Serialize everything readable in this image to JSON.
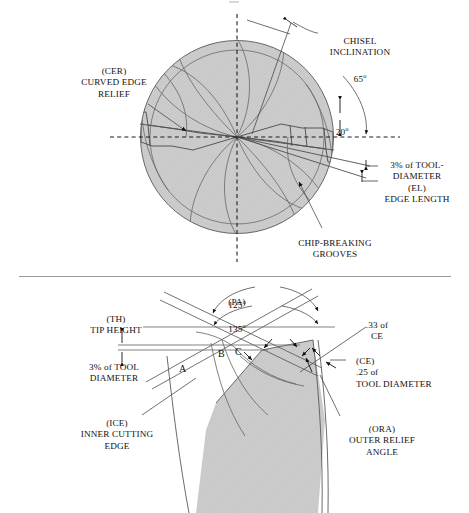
{
  "page": {
    "width": 469,
    "height": 513,
    "background": "#ffffff",
    "ink": "#111111",
    "hatch_fill": "#c9c9c9",
    "line_color": "#555555",
    "divider_color": "#9a9a9a"
  },
  "figure_top": {
    "name": "drill-point-end-view",
    "circle": {
      "cx": 237,
      "cy": 137,
      "r": 97
    },
    "labels": {
      "cer": "(CER)\nCURVED EDGE\nRELIEF",
      "chisel_inclination": "CHISEL\nINCLINATION",
      "chisel_inclination_value": "65",
      "chisel_inclination_unit": "o",
      "angle_20_value": "20",
      "angle_20_unit": "o",
      "edge_length": "3% of TOOL-\nDIAMETER\n(EL)\nEDGE LENGTH",
      "chip_grooves": "CHIP-BREAKING\nGROOVES"
    }
  },
  "figure_bottom": {
    "name": "drill-point-side-view",
    "labels": {
      "pa_upper_value": "125",
      "pa_upper_unit": "o",
      "pa_tag": "(PA)",
      "pa_lower_value": "135",
      "pa_lower_unit": "o",
      "tip_height": "(TH)\nTIP HEIGHT",
      "tool_diameter_3pct": "3% of TOOL\nDIAMETER",
      "ce_33": ".33 of\nCE",
      "ce_25": "(CE)\n.25 of\nTOOL DIAMETER",
      "ice": "(ICE)\nINNER CUTTING\nEDGE",
      "ora": "(ORA)\nOUTER RELIEF\nANGLE",
      "zone_a": "A",
      "zone_b": "B",
      "zone_c": "C"
    }
  }
}
